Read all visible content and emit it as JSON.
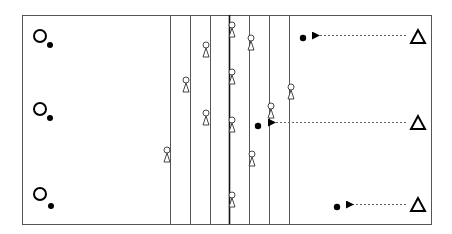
{
  "diagram": {
    "type": "drill-diagram",
    "width": 452,
    "height": 234,
    "colors": {
      "line": "#555555",
      "ink": "#000000",
      "dash": "#666666",
      "background": "#ffffff"
    },
    "frame": {
      "x": 22,
      "y": 15,
      "w": 409,
      "h": 209
    },
    "lanes_x": [
      170,
      190,
      210,
      229,
      249,
      269,
      289
    ],
    "center_lane_x": 229,
    "left_players": [
      {
        "icon": "circle-player-icon",
        "cx": 40,
        "cy": 36,
        "ball": {
          "cx": 50,
          "cy": 45
        }
      },
      {
        "icon": "circle-player-icon",
        "cx": 40,
        "cy": 109,
        "ball": {
          "cx": 50,
          "cy": 118
        }
      },
      {
        "icon": "circle-player-icon",
        "cx": 40,
        "cy": 194,
        "ball": {
          "cx": 51,
          "cy": 206
        }
      }
    ],
    "cones": [
      {
        "x": 167,
        "y": 150
      },
      {
        "x": 186,
        "y": 80
      },
      {
        "x": 206,
        "y": 45
      },
      {
        "x": 206,
        "y": 113
      },
      {
        "x": 232,
        "y": 25
      },
      {
        "x": 232,
        "y": 72
      },
      {
        "x": 232,
        "y": 120
      },
      {
        "x": 232,
        "y": 195
      },
      {
        "x": 251,
        "y": 38
      },
      {
        "x": 252,
        "y": 154
      },
      {
        "x": 271,
        "y": 106
      },
      {
        "x": 291,
        "y": 87
      }
    ],
    "right_passes": [
      {
        "triangle": {
          "cx": 418,
          "cy": 37
        },
        "arrow": {
          "x1": 406,
          "x2": 314,
          "y": 35
        },
        "ball": {
          "cx": 303,
          "cy": 38
        }
      },
      {
        "triangle": {
          "cx": 418,
          "cy": 123
        },
        "arrow": {
          "x1": 406,
          "x2": 270,
          "y": 122
        },
        "ball": {
          "cx": 258,
          "cy": 126
        }
      },
      {
        "triangle": {
          "cx": 418,
          "cy": 205
        },
        "arrow": {
          "x1": 406,
          "x2": 348,
          "y": 204
        },
        "ball": {
          "cx": 337,
          "cy": 207
        }
      }
    ]
  }
}
